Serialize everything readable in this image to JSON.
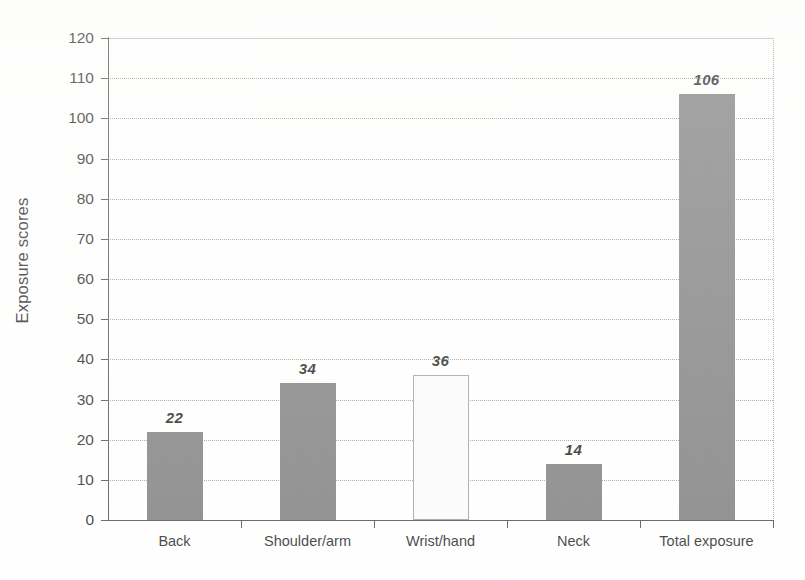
{
  "chart_data": {
    "type": "bar",
    "title": "",
    "subtitle": "",
    "xlabel": "",
    "ylabel": "Exposure scores",
    "categories": [
      "Back",
      "Shoulder/arm",
      "Wrist/hand",
      "Neck",
      "Total exposure"
    ],
    "values": [
      22,
      34,
      36,
      14,
      106
    ],
    "data_labels": [
      "22",
      "34",
      "36",
      "14",
      "106"
    ],
    "bar_styles": [
      "filled",
      "filled",
      "open",
      "filled",
      "filled"
    ],
    "ylim": [
      0,
      120
    ],
    "ytick_step": 10,
    "ytick_labels": [
      "0",
      "10",
      "20",
      "30",
      "40",
      "50",
      "60",
      "70",
      "80",
      "90",
      "100",
      "110",
      "120"
    ],
    "grid": true,
    "grid_axis": "y",
    "grid_style": "dotted",
    "legend": false,
    "legend_position": "none",
    "series": [
      {
        "name": "Exposure scores",
        "values": [
          22,
          34,
          36,
          14,
          106
        ]
      }
    ],
    "colors": {
      "bar_filled": "#787878",
      "bar_open_fill": "#fbfbfb",
      "bar_open_border": "#9d9d9d",
      "gridline": "#9a9a9a",
      "axis": "#4a4a4a",
      "text": "#1f1f1f",
      "background": "#ffffff"
    }
  }
}
